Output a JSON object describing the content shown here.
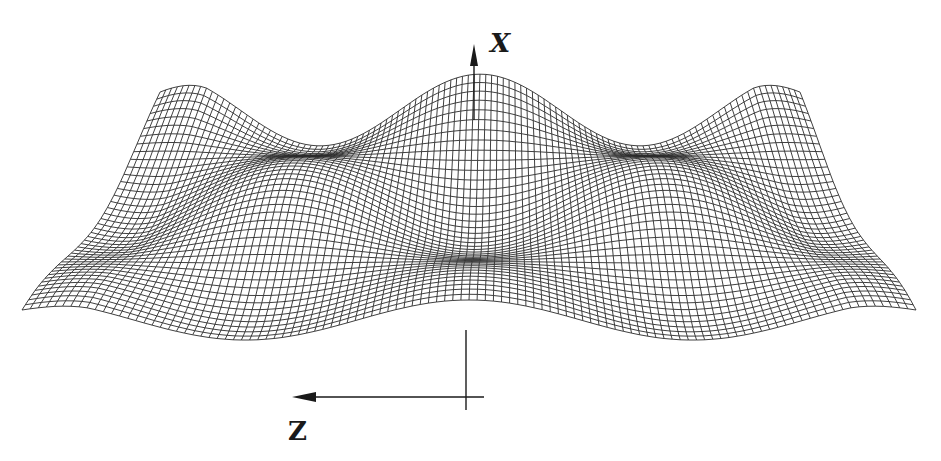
{
  "figure": {
    "type": "3d-wireframe-surface",
    "line_color": "#2a2a2a",
    "background": "#ffffff"
  },
  "axes": {
    "vertical": {
      "label": "X"
    },
    "horizontal": {
      "label": "Z"
    }
  },
  "mesh": {
    "rows": 42,
    "cols": 110,
    "front_y": 320,
    "back_y": 128,
    "front_left_x": 22,
    "front_right_x": 916,
    "back_left_x": 160,
    "back_right_x": 800,
    "amplitude": 75,
    "period_x": 2,
    "period_z": 1.5
  }
}
